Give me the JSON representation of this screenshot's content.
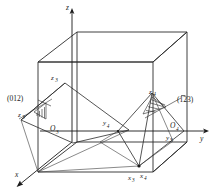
{
  "figure": {
    "kind": "crystallographic-miller-index-diagram"
  },
  "axes": [
    {
      "name": "z-axis",
      "label": "z",
      "id": "axis-z"
    },
    {
      "name": "y-axis",
      "label": "y",
      "id": "axis-y"
    },
    {
      "name": "x-axis",
      "label": "x",
      "id": "axis-x"
    }
  ],
  "plane_labels": [
    {
      "id": "plane-012",
      "text": "(012)",
      "prefix": "(",
      "digits": "012",
      "suffix": ")",
      "overbar": false
    },
    {
      "id": "plane-1bar23",
      "text": "(123)",
      "prefix": "(",
      "bar_digit": "1",
      "digits": "23",
      "suffix": ")",
      "overbar": true
    }
  ],
  "points": [
    {
      "id": "origin-3",
      "base": "O",
      "sub": "3"
    },
    {
      "id": "origin-4",
      "base": "O",
      "sub": "4"
    },
    {
      "id": "z3-top",
      "base": "z",
      "sub": "3"
    },
    {
      "id": "z3-left",
      "base": "z",
      "sub": "3"
    },
    {
      "id": "z4",
      "base": "z",
      "sub": "4"
    },
    {
      "id": "y4",
      "base": "y",
      "sub": "4"
    },
    {
      "id": "y3",
      "base": "y",
      "sub": "3"
    },
    {
      "id": "x3",
      "base": "x",
      "sub": "3"
    },
    {
      "id": "x4",
      "base": "x",
      "sub": "4"
    }
  ],
  "colors": {
    "ink": "#1a1a1a",
    "line": "#2a2a2a",
    "background": "#ffffff"
  }
}
